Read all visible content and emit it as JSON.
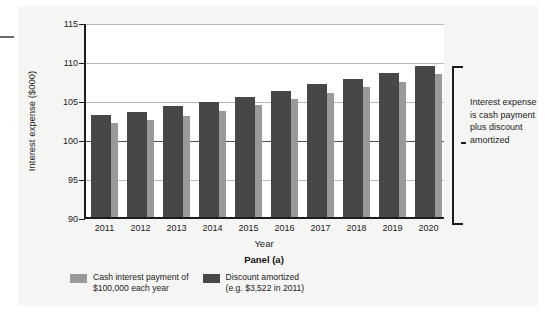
{
  "figure": {
    "panel_label": "Panel (a)",
    "annotation": "Interest expense is cash payment plus discount amortized",
    "colors": {
      "cash_payment": "#9a9a9a",
      "discount_amortized": "#474747",
      "background": "#f5f5f3",
      "axis": "#1c1c1c",
      "gridline": "#b9b9b9"
    }
  },
  "legend": {
    "items": [
      {
        "label": "Cash interest payment of\n$100,000 each year",
        "color": "#9a9a9a",
        "swatch": "light-gray-swatch"
      },
      {
        "label": "Discount amortized\n(e.g. $3,522 in 2011)",
        "color": "#474747",
        "swatch": "dark-gray-swatch"
      }
    ]
  },
  "chart_data": {
    "type": "bar",
    "title": "Panel (a)",
    "xlabel": "Year",
    "ylabel": "Interest expense ($000)",
    "ylim": [
      90,
      115
    ],
    "yticks": [
      90,
      95,
      100,
      105,
      110,
      115
    ],
    "ytick_labels": [
      "90",
      "95",
      "100",
      "105",
      "110",
      "115"
    ],
    "grid": true,
    "legend_position": "below-axes",
    "categories": [
      "2011",
      "2012",
      "2013",
      "2014",
      "2015",
      "2016",
      "2017",
      "2018",
      "2019",
      "2020"
    ],
    "series": [
      {
        "name": "Discount amortized (e.g. $3,522 in 2011)",
        "color": "#474747",
        "note": "front bar: total interest expense = cash payment + discount amortized",
        "values": [
          103.1,
          103.5,
          104.2,
          104.7,
          105.4,
          106.1,
          107.0,
          107.7,
          108.4,
          109.3
        ]
      },
      {
        "name": "Cash interest payment of $100,000 each year",
        "color": "#9a9a9a",
        "note": "rear bar offset right, rises behind the front bar",
        "values": [
          102.1,
          102.4,
          103.0,
          103.6,
          104.4,
          105.1,
          105.9,
          106.7,
          107.3,
          108.3
        ]
      }
    ],
    "cash_payment_each_year": 100,
    "annotation": "Interest expense is cash payment plus discount amortized"
  }
}
